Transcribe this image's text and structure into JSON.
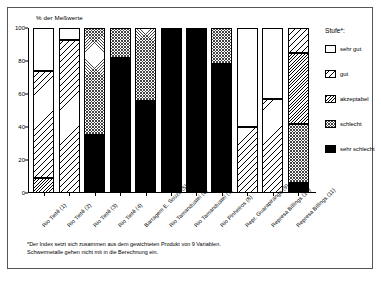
{
  "chart_data": {
    "type": "bar",
    "subtype": "stacked-100-percent",
    "title": "",
    "xlabel": "",
    "ylabel": "% der Meßwerte",
    "ylim": [
      0,
      100
    ],
    "yticks": [
      0,
      20,
      40,
      60,
      80,
      100
    ],
    "grid": false,
    "legend_position": "right",
    "legend_title": "Stufe*:",
    "categories": [
      "Rio Tietê (1)",
      "Rio Tietê (2)",
      "Rio Tietê (3)",
      "Rio Tietê (4)",
      "Barragem E. Souza (5)",
      "Rio Tamanduateí (6)",
      "Rio Tamanduateí (7)",
      "Rio Pinheiros (8)",
      "Repr. Guarapiranga (9)",
      "Represa Billings (10)",
      "Represa Billings (11)"
    ],
    "series": [
      {
        "name": "sehr gut",
        "pattern": "empty",
        "values": [
          26,
          7,
          0,
          0,
          0,
          0,
          0,
          0,
          60,
          43,
          0
        ]
      },
      {
        "name": "gut",
        "pattern": "diagonal-sparse",
        "values": [
          65,
          93,
          0,
          0,
          0,
          0,
          0,
          0,
          40,
          57,
          15
        ]
      },
      {
        "name": "akzeptabel",
        "pattern": "diagonal-dense",
        "values": [
          9,
          0,
          0,
          0,
          0,
          0,
          0,
          0,
          0,
          0,
          43
        ]
      },
      {
        "name": "schlecht",
        "pattern": "cross-hatch",
        "values": [
          0,
          0,
          65,
          18,
          44,
          0,
          0,
          22,
          0,
          0,
          36
        ]
      },
      {
        "name": "sehr schlecht",
        "pattern": "solid-black",
        "values": [
          0,
          0,
          35,
          82,
          56,
          100,
          100,
          78,
          0,
          0,
          6
        ]
      }
    ],
    "stack_boundaries": [
      [
        0,
        9,
        74,
        100
      ],
      [
        0,
        93,
        100
      ],
      [
        0,
        35,
        100
      ],
      [
        0,
        82,
        100
      ],
      [
        0,
        56,
        100
      ],
      [
        0,
        100
      ],
      [
        0,
        100
      ],
      [
        0,
        78,
        100
      ],
      [
        0,
        40,
        100
      ],
      [
        0,
        57,
        100
      ],
      [
        0,
        6,
        42,
        85,
        100
      ]
    ],
    "footnote": [
      "*Der Index setzt sich zusammen aus dem gewichteten Produkt von 9 Variablen.",
      "Schwermetalle gehen nicht mit in die Berechnung ein."
    ]
  },
  "legend": {
    "title": "Stufe*:",
    "items": [
      {
        "label": "sehr gut"
      },
      {
        "label": "gut"
      },
      {
        "label": "akzeptabel"
      },
      {
        "label": "schlecht"
      },
      {
        "label": "sehr schlecht"
      }
    ]
  },
  "axis": {
    "y_title": "% der Meßwerte",
    "y_ticks": [
      "100",
      "80",
      "60",
      "40",
      "20",
      "0"
    ]
  },
  "footnote": {
    "line1": "*Der Index setzt sich zusammen aus dem gewichteten Produkt von 9 Variablen.",
    "line2": "Schwermetalle gehen nicht mit in die Berechnung ein."
  }
}
